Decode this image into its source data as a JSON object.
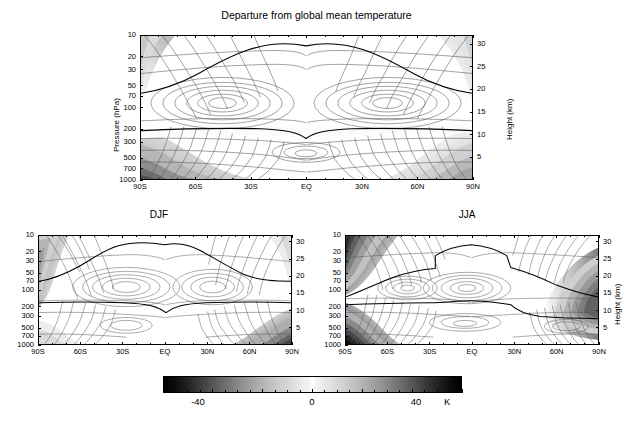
{
  "figure": {
    "title": "Departure from global mean temperature",
    "axis_titles": {
      "pressure": "Pressure  (hPa)",
      "height": "Height (km)"
    }
  },
  "axes": {
    "pressure_ticks": [
      "10",
      "20",
      "30",
      "50",
      "70",
      "100",
      "200",
      "300",
      "500",
      "700",
      "1000"
    ],
    "pressure_values": [
      10,
      20,
      30,
      50,
      70,
      100,
      200,
      300,
      500,
      700,
      1000
    ],
    "height_ticks": [
      "30",
      "25",
      "20",
      "15",
      "10",
      "5"
    ],
    "height_values": [
      30,
      25,
      20,
      15,
      10,
      5
    ],
    "latitude_ticks": [
      "90S",
      "60S",
      "30S",
      "EQ",
      "30N",
      "60N",
      "90N"
    ],
    "latitude_values": [
      -90,
      -60,
      -30,
      0,
      30,
      60,
      90
    ]
  },
  "panels": [
    {
      "id": "annual",
      "title": "",
      "show_pressure_title": true,
      "show_height_title": true
    },
    {
      "id": "djf",
      "title": "DJF",
      "show_pressure_title": false,
      "show_height_title": false
    },
    {
      "id": "jja",
      "title": "JJA",
      "show_pressure_title": false,
      "show_height_title": true
    }
  ],
  "colorbar": {
    "labels": [
      "-40",
      "0",
      "40"
    ],
    "values": [
      -40,
      0,
      40
    ],
    "unit": "K",
    "min": -60,
    "max": 60,
    "color_min": "#000000",
    "color_mid": "#ffffff",
    "color_max": "#000000"
  },
  "chart_data": {
    "type": "heatmap",
    "title": "Departure from global mean temperature",
    "subtitle": "",
    "xlabel": "",
    "ylabel": "Pressure  (hPa)",
    "ylabel_right": "Height (km)",
    "colorbar_label": "K",
    "grid": false,
    "legend_position": "bottom",
    "x": [
      -90,
      -75,
      -60,
      -45,
      -30,
      -15,
      0,
      15,
      30,
      45,
      60,
      75,
      90
    ],
    "xtick_labels": [
      "90S",
      "60S",
      "30S",
      "EQ",
      "30N",
      "60N",
      "90N"
    ],
    "xtick_values": [
      -90,
      -60,
      -30,
      0,
      30,
      60,
      90
    ],
    "y_pressure": [
      10,
      20,
      30,
      50,
      70,
      100,
      200,
      300,
      500,
      700,
      1000
    ],
    "ytick_labels": [
      "10",
      "20",
      "30",
      "50",
      "70",
      "100",
      "200",
      "300",
      "500",
      "700",
      "1000"
    ],
    "y2tick_labels": [
      "5",
      "10",
      "15",
      "20",
      "25",
      "30"
    ],
    "y2tick_values": [
      5,
      10,
      15,
      20,
      25,
      30
    ],
    "ylim_pressure": [
      10,
      1000
    ],
    "ylim_height": [
      0,
      32
    ],
    "zlim": [
      -60,
      60
    ],
    "contour_interval": 5,
    "bold_contour_levels": [
      0
    ],
    "colormap": "grayscale_diverging",
    "units": "K",
    "panels": [
      {
        "name": "Annual",
        "title": "",
        "notes": "Annual-mean zonal cross-section. Warm positive departure (white) centred near 100 hPa over the tropics and sub-tropics; strong cold departure (dark shading) near the surface at 90S and in the polar upper stratosphere.",
        "values_by_pressure": {
          "10": [
            -30,
            -22,
            -12,
            -4,
            2,
            6,
            8,
            6,
            2,
            -4,
            -12,
            -22,
            -30
          ],
          "20": [
            -22,
            -16,
            -8,
            0,
            6,
            10,
            12,
            10,
            6,
            0,
            -8,
            -16,
            -24
          ],
          "30": [
            -16,
            -10,
            -2,
            6,
            12,
            16,
            18,
            16,
            12,
            6,
            -2,
            -10,
            -18
          ],
          "50": [
            -10,
            -4,
            4,
            12,
            18,
            22,
            24,
            22,
            18,
            12,
            4,
            -4,
            -12
          ],
          "70": [
            -6,
            0,
            8,
            16,
            22,
            26,
            28,
            26,
            22,
            16,
            8,
            0,
            -8
          ],
          "100": [
            -4,
            2,
            10,
            18,
            24,
            28,
            30,
            28,
            24,
            18,
            10,
            2,
            -6
          ],
          "200": [
            -6,
            -2,
            4,
            10,
            14,
            16,
            16,
            16,
            14,
            10,
            4,
            -2,
            -8
          ],
          "300": [
            -14,
            -10,
            -4,
            2,
            6,
            8,
            8,
            8,
            6,
            2,
            -4,
            -10,
            -16
          ],
          "500": [
            -22,
            -16,
            -8,
            -2,
            2,
            4,
            4,
            4,
            2,
            -2,
            -8,
            -16,
            -24
          ],
          "700": [
            -32,
            -24,
            -14,
            -6,
            0,
            2,
            2,
            2,
            0,
            -6,
            -14,
            -24,
            -34
          ],
          "1000": [
            -46,
            -34,
            -20,
            -8,
            -2,
            0,
            0,
            0,
            -2,
            -8,
            -20,
            -34,
            -48
          ]
        }
      },
      {
        "name": "DJF",
        "title": "DJF",
        "notes": "December-January-February. Southern high latitudes relatively mild near surface; northern polar surface strongly cold (dark). Tropical warm maximum near 100 hPa extends into the northern subtropics.",
        "values_by_pressure": {
          "10": [
            -24,
            -16,
            -6,
            2,
            8,
            10,
            10,
            8,
            4,
            -2,
            -10,
            -20,
            -28
          ],
          "20": [
            -18,
            -10,
            -2,
            6,
            12,
            16,
            16,
            14,
            10,
            4,
            -4,
            -14,
            -22
          ],
          "30": [
            -14,
            -6,
            2,
            10,
            16,
            20,
            20,
            18,
            14,
            8,
            0,
            -10,
            -18
          ],
          "50": [
            -10,
            -2,
            6,
            14,
            20,
            24,
            24,
            22,
            18,
            12,
            4,
            -6,
            -14
          ],
          "70": [
            -8,
            0,
            10,
            18,
            24,
            28,
            28,
            26,
            22,
            16,
            8,
            -2,
            -10
          ],
          "100": [
            -6,
            2,
            12,
            20,
            26,
            30,
            30,
            28,
            24,
            18,
            10,
            0,
            -8
          ],
          "200": [
            -8,
            -2,
            6,
            12,
            16,
            18,
            18,
            16,
            14,
            10,
            2,
            -6,
            -12
          ],
          "300": [
            -14,
            -8,
            -2,
            4,
            8,
            10,
            10,
            8,
            4,
            -2,
            -8,
            -16,
            -22
          ],
          "500": [
            -18,
            -12,
            -6,
            0,
            4,
            6,
            6,
            4,
            0,
            -6,
            -14,
            -24,
            -30
          ],
          "700": [
            -24,
            -18,
            -10,
            -4,
            2,
            4,
            4,
            2,
            -2,
            -10,
            -20,
            -32,
            -40
          ],
          "1000": [
            -32,
            -24,
            -14,
            -6,
            0,
            2,
            2,
            0,
            -4,
            -14,
            -26,
            -42,
            -52
          ]
        }
      },
      {
        "name": "JJA",
        "title": "JJA",
        "notes": "June-July-August. Southern polar region extremely cold at both surface and upper stratosphere (dark shading at 90S); northern polar upper troposphere/lower stratosphere cold. Tropical warm core near 100 hPa.",
        "values_by_pressure": {
          "10": [
            -44,
            -30,
            -14,
            0,
            6,
            8,
            8,
            6,
            0,
            -8,
            -16,
            -24,
            -30
          ],
          "20": [
            -42,
            -28,
            -12,
            2,
            10,
            14,
            14,
            12,
            6,
            -2,
            -12,
            -20,
            -26
          ],
          "30": [
            -38,
            -24,
            -8,
            6,
            14,
            18,
            18,
            16,
            10,
            2,
            -8,
            -16,
            -22
          ],
          "50": [
            -30,
            -16,
            0,
            12,
            20,
            24,
            24,
            22,
            16,
            8,
            -2,
            -12,
            -18
          ],
          "70": [
            -24,
            -10,
            8,
            18,
            24,
            28,
            28,
            26,
            20,
            12,
            2,
            -10,
            -16
          ],
          "100": [
            -20,
            -6,
            12,
            20,
            26,
            30,
            30,
            28,
            22,
            14,
            4,
            -8,
            -14
          ],
          "200": [
            -22,
            -10,
            2,
            10,
            14,
            16,
            16,
            16,
            12,
            6,
            -4,
            -14,
            -20
          ],
          "300": [
            -32,
            -18,
            -6,
            2,
            6,
            8,
            8,
            8,
            4,
            -2,
            -10,
            -18,
            -24
          ],
          "500": [
            -44,
            -26,
            -12,
            -2,
            2,
            4,
            4,
            4,
            2,
            -2,
            -8,
            -14,
            -18
          ],
          "700": [
            -54,
            -34,
            -16,
            -6,
            0,
            2,
            2,
            2,
            0,
            -4,
            -8,
            -12,
            -16
          ],
          "1000": [
            -62,
            -42,
            -20,
            -8,
            -2,
            0,
            0,
            0,
            -2,
            -4,
            -8,
            -10,
            -14
          ]
        }
      }
    ]
  }
}
